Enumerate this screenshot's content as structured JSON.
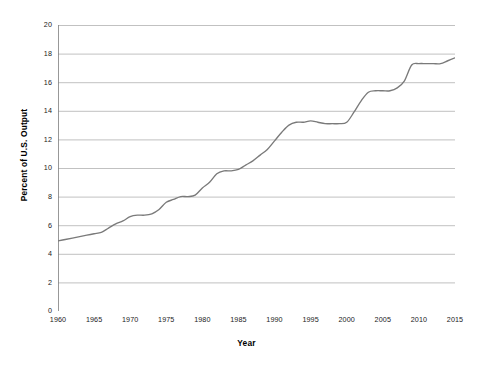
{
  "chart_data": {
    "type": "line",
    "title": "",
    "xlabel": "Year",
    "ylabel": "Percent of U.S. Output",
    "xlim": [
      1960,
      2015
    ],
    "ylim": [
      0,
      20
    ],
    "ytick_step": 2,
    "xtick_step": 5,
    "grid": true,
    "grid_axis": "y",
    "legend": "none",
    "line_color": "#7a7a7a",
    "grid_color": "#a6a6a6",
    "axis_color": "#8c8c8c",
    "background_color": "#ffffff",
    "text_color": "#1a1a1a",
    "x_tick_labels": [
      "1960",
      "1965",
      "1970",
      "1975",
      "1980",
      "1985",
      "1990",
      "1995",
      "2000",
      "2005",
      "2010",
      "2015"
    ],
    "y_tick_labels": [
      "0",
      "2",
      "4",
      "6",
      "8",
      "10",
      "12",
      "14",
      "16",
      "18",
      "20"
    ],
    "x": [
      1960,
      1961,
      1962,
      1963,
      1964,
      1965,
      1966,
      1967,
      1968,
      1969,
      1970,
      1971,
      1972,
      1973,
      1974,
      1975,
      1976,
      1977,
      1978,
      1979,
      1980,
      1981,
      1982,
      1983,
      1984,
      1985,
      1986,
      1987,
      1988,
      1989,
      1990,
      1991,
      1992,
      1993,
      1994,
      1995,
      1996,
      1997,
      1998,
      1999,
      2000,
      2001,
      2002,
      2003,
      2004,
      2005,
      2006,
      2007,
      2008,
      2009,
      2010,
      2011,
      2012,
      2013,
      2014,
      2015
    ],
    "series": [
      {
        "name": "Health spending share of U.S. output",
        "values": [
          4.9,
          5.0,
          5.1,
          5.2,
          5.3,
          5.4,
          5.5,
          5.8,
          6.1,
          6.3,
          6.6,
          6.7,
          6.7,
          6.8,
          7.1,
          7.6,
          7.8,
          8.0,
          8.0,
          8.1,
          8.6,
          9.0,
          9.6,
          9.8,
          9.8,
          9.9,
          10.2,
          10.5,
          10.9,
          11.3,
          11.9,
          12.5,
          13.0,
          13.2,
          13.2,
          13.3,
          13.2,
          13.1,
          13.1,
          13.1,
          13.2,
          13.9,
          14.7,
          15.3,
          15.4,
          15.4,
          15.4,
          15.6,
          16.1,
          17.2,
          17.3,
          17.3,
          17.3,
          17.3,
          17.5,
          17.7
        ]
      }
    ]
  }
}
